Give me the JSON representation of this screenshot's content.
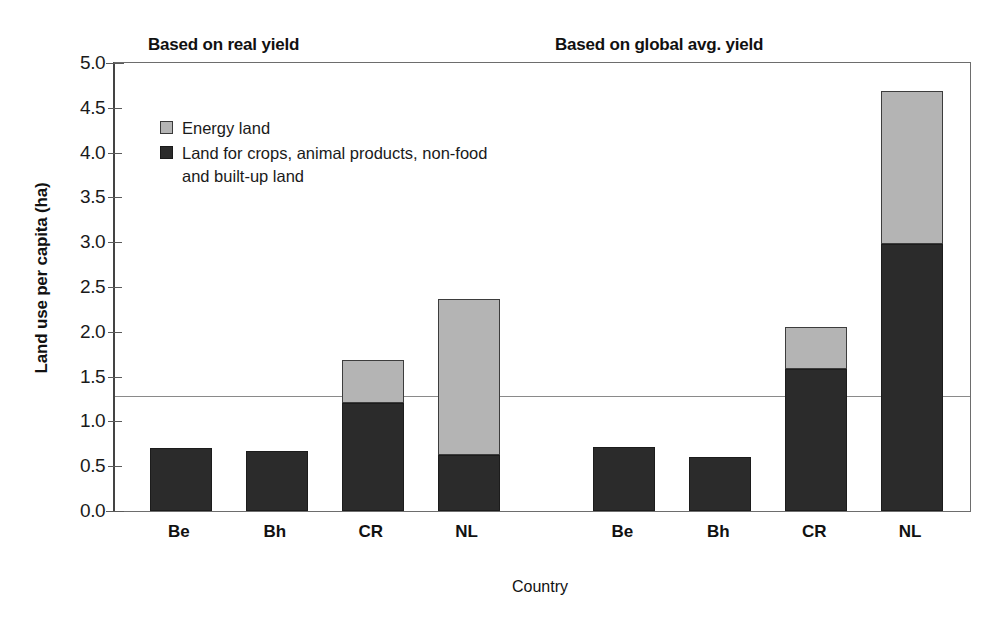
{
  "chart_data": {
    "type": "bar",
    "stacked": true,
    "title": "",
    "panel_titles": [
      "Based on real yield",
      "Based on global avg. yield"
    ],
    "xlabel": "Country",
    "ylabel": "Land use per capita (ha)",
    "ylim": [
      0.0,
      5.0
    ],
    "ytick_labels": [
      "0.0",
      "0.5",
      "1.0",
      "1.5",
      "2.0",
      "2.5",
      "3.0",
      "3.5",
      "4.0",
      "4.5",
      "5.0"
    ],
    "ytick_values": [
      0.0,
      0.5,
      1.0,
      1.5,
      2.0,
      2.5,
      3.0,
      3.5,
      4.0,
      4.5,
      5.0
    ],
    "grid": false,
    "legend_position": "upper left",
    "categories": [
      "Be",
      "Bh",
      "CR",
      "NL",
      "Be",
      "Bh",
      "CR",
      "NL"
    ],
    "groups": [
      {
        "name": "Based on real yield",
        "categories": [
          "Be",
          "Bh",
          "CR",
          "NL"
        ]
      },
      {
        "name": "Based on global avg. yield",
        "categories": [
          "Be",
          "Bh",
          "CR",
          "NL"
        ]
      }
    ],
    "series": [
      {
        "name": "Land for crops, animal products, non-food and built-up land",
        "color": "#2b2b2b",
        "values": [
          0.7,
          0.67,
          1.21,
          0.63,
          0.72,
          0.6,
          1.58,
          2.98
        ]
      },
      {
        "name": "Energy land",
        "color": "#b4b4b4",
        "values": [
          0.0,
          0.0,
          0.47,
          1.74,
          0.0,
          0.0,
          0.47,
          1.71
        ]
      }
    ],
    "totals": [
      0.7,
      0.67,
      1.68,
      2.37,
      0.72,
      0.6,
      2.05,
      4.69
    ],
    "reference_line": {
      "value": 1.28,
      "label": ""
    },
    "annotations": []
  },
  "legend": {
    "entries": [
      {
        "label": "Energy land",
        "swatch": "light"
      },
      {
        "label": "Land for crops, animal products, non-food\nand built-up land",
        "swatch": "dark"
      }
    ]
  }
}
